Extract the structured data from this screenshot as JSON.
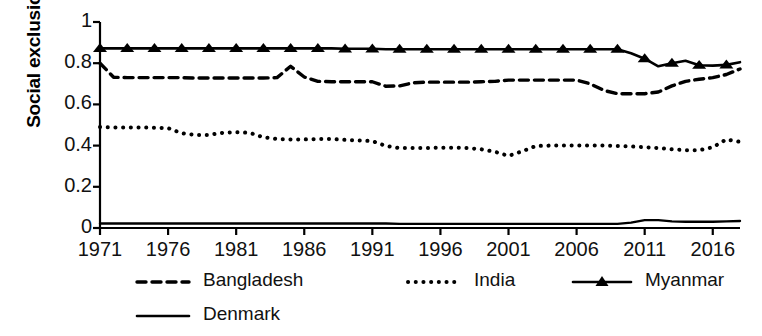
{
  "chart_data": {
    "type": "line",
    "title": "",
    "xlabel": "",
    "ylabel": "Social exclusion",
    "xlim": [
      1971,
      2018
    ],
    "ylim": [
      0,
      1
    ],
    "grid": false,
    "legend_position": "bottom",
    "y_ticks": [
      "0",
      "0.2",
      "0.4",
      "0.6",
      "0.8",
      "1"
    ],
    "y_tick_values": [
      0,
      0.2,
      0.4,
      0.6,
      0.8,
      1
    ],
    "x_ticks": [
      "1971",
      "1976",
      "1981",
      "1986",
      "1991",
      "1996",
      "2001",
      "2006",
      "2011",
      "2016"
    ],
    "x_tick_values": [
      1971,
      1976,
      1981,
      1986,
      1991,
      1996,
      2001,
      2006,
      2011,
      2016
    ],
    "x": [
      1971,
      1972,
      1973,
      1974,
      1975,
      1976,
      1977,
      1978,
      1979,
      1980,
      1981,
      1982,
      1983,
      1984,
      1985,
      1986,
      1987,
      1988,
      1989,
      1990,
      1991,
      1992,
      1993,
      1994,
      1995,
      1996,
      1997,
      1998,
      1999,
      2000,
      2001,
      2002,
      2003,
      2004,
      2005,
      2006,
      2007,
      2008,
      2009,
      2010,
      2011,
      2012,
      2013,
      2014,
      2015,
      2016,
      2017,
      2018
    ],
    "series": [
      {
        "name": "Bangladesh",
        "style": "dashed",
        "color": "#000000",
        "values": [
          0.8,
          0.732,
          0.73,
          0.73,
          0.73,
          0.73,
          0.73,
          0.728,
          0.728,
          0.728,
          0.728,
          0.728,
          0.728,
          0.73,
          0.785,
          0.733,
          0.712,
          0.71,
          0.71,
          0.71,
          0.71,
          0.688,
          0.69,
          0.705,
          0.708,
          0.708,
          0.708,
          0.708,
          0.71,
          0.712,
          0.718,
          0.718,
          0.718,
          0.718,
          0.718,
          0.718,
          0.7,
          0.668,
          0.652,
          0.652,
          0.652,
          0.66,
          0.69,
          0.712,
          0.722,
          0.73,
          0.745,
          0.772
        ]
      },
      {
        "name": "India",
        "style": "dotted",
        "color": "#000000",
        "values": [
          0.49,
          0.488,
          0.488,
          0.488,
          0.487,
          0.485,
          0.46,
          0.452,
          0.452,
          0.462,
          0.465,
          0.462,
          0.44,
          0.432,
          0.43,
          0.43,
          0.432,
          0.432,
          0.428,
          0.425,
          0.422,
          0.398,
          0.388,
          0.388,
          0.388,
          0.39,
          0.39,
          0.388,
          0.382,
          0.37,
          0.35,
          0.372,
          0.398,
          0.4,
          0.4,
          0.4,
          0.4,
          0.4,
          0.398,
          0.396,
          0.392,
          0.388,
          0.382,
          0.378,
          0.378,
          0.392,
          0.43,
          0.418
        ]
      },
      {
        "name": "Myanmar",
        "style": "solid-marker",
        "marker": "triangle",
        "color": "#000000",
        "values": [
          0.872,
          0.872,
          0.872,
          0.872,
          0.872,
          0.872,
          0.872,
          0.872,
          0.872,
          0.872,
          0.872,
          0.872,
          0.872,
          0.872,
          0.872,
          0.872,
          0.872,
          0.872,
          0.87,
          0.87,
          0.87,
          0.868,
          0.868,
          0.868,
          0.868,
          0.868,
          0.868,
          0.868,
          0.868,
          0.868,
          0.868,
          0.868,
          0.868,
          0.868,
          0.868,
          0.868,
          0.868,
          0.868,
          0.868,
          0.848,
          0.822,
          0.785,
          0.8,
          0.812,
          0.79,
          0.788,
          0.792,
          0.805
        ]
      },
      {
        "name": "Denmark",
        "style": "solid",
        "color": "#000000",
        "values": [
          0.022,
          0.022,
          0.022,
          0.022,
          0.022,
          0.022,
          0.022,
          0.022,
          0.022,
          0.022,
          0.022,
          0.022,
          0.022,
          0.022,
          0.022,
          0.022,
          0.022,
          0.022,
          0.022,
          0.022,
          0.022,
          0.022,
          0.02,
          0.02,
          0.02,
          0.02,
          0.02,
          0.02,
          0.02,
          0.02,
          0.02,
          0.02,
          0.02,
          0.02,
          0.02,
          0.02,
          0.02,
          0.02,
          0.02,
          0.026,
          0.038,
          0.038,
          0.032,
          0.03,
          0.03,
          0.03,
          0.032,
          0.034
        ]
      }
    ],
    "legend": [
      {
        "label": "Bangladesh",
        "style": "dashed"
      },
      {
        "label": "India",
        "style": "dotted"
      },
      {
        "label": "Myanmar",
        "style": "solid-marker"
      },
      {
        "label": "Denmark",
        "style": "solid"
      }
    ]
  }
}
